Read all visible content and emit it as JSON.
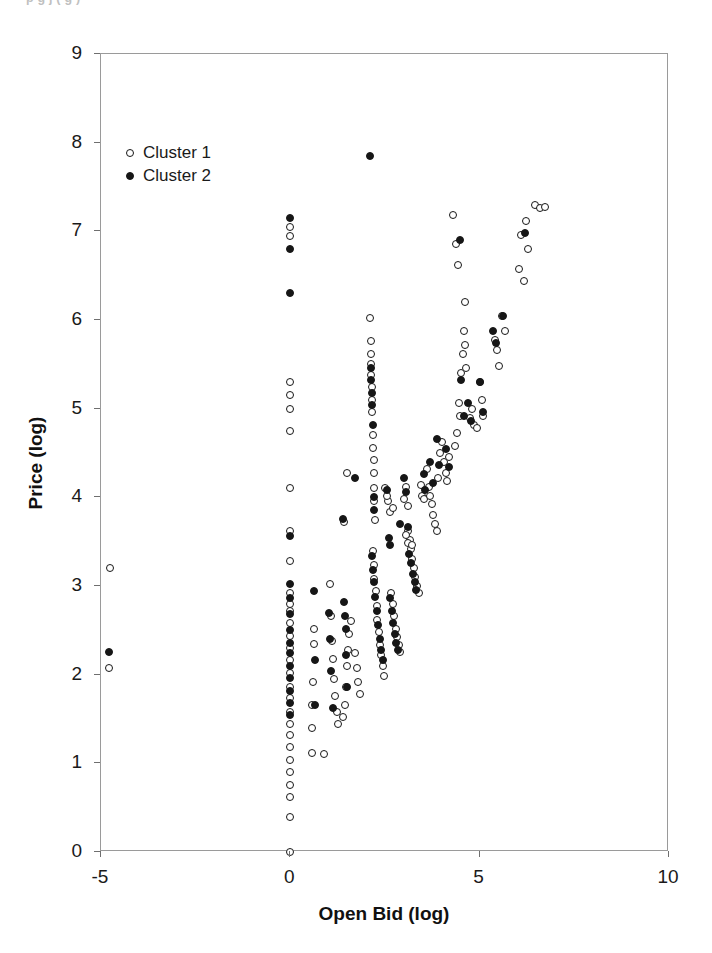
{
  "figure": {
    "cropped_caption": "p g j ( g )",
    "background_color": "#ffffff",
    "frame_color": "#9a9a9a",
    "marker_color": "#161616"
  },
  "chart_data": {
    "type": "scatter",
    "title": "",
    "xlabel": "Open Bid (log)",
    "ylabel": "Price (log)",
    "xlim": [
      -5,
      10
    ],
    "ylim": [
      0,
      9
    ],
    "xticks": [
      -5,
      0,
      5,
      10
    ],
    "yticks": [
      0,
      1,
      2,
      3,
      4,
      5,
      6,
      7,
      8,
      9
    ],
    "xtick_labels": [
      "-5",
      "0",
      "5",
      "10"
    ],
    "ytick_labels": [
      "0",
      "1",
      "2",
      "3",
      "4",
      "5",
      "6",
      "7",
      "8",
      "9"
    ],
    "grid": false,
    "legend_position": "upper-left-inside",
    "series": [
      {
        "name": "Cluster 1",
        "marker": "open-circle",
        "color": "#161616",
        "points": [
          [
            -4.75,
            3.2
          ],
          [
            -4.78,
            2.08
          ],
          [
            0.0,
            7.05
          ],
          [
            0.0,
            6.95
          ],
          [
            0.0,
            5.3
          ],
          [
            0.0,
            5.15
          ],
          [
            0.0,
            5.0
          ],
          [
            0.0,
            4.75
          ],
          [
            0.0,
            4.1
          ],
          [
            0.0,
            3.62
          ],
          [
            0.0,
            3.28
          ],
          [
            0.0,
            2.92
          ],
          [
            0.0,
            2.8
          ],
          [
            0.0,
            2.72
          ],
          [
            0.0,
            2.58
          ],
          [
            0.0,
            2.44
          ],
          [
            0.0,
            2.3
          ],
          [
            0.0,
            2.16
          ],
          [
            0.0,
            2.02
          ],
          [
            0.0,
            1.86
          ],
          [
            0.0,
            1.74
          ],
          [
            0.0,
            1.58
          ],
          [
            0.0,
            1.44
          ],
          [
            0.0,
            1.32
          ],
          [
            0.0,
            1.18
          ],
          [
            0.0,
            1.04
          ],
          [
            0.0,
            0.9
          ],
          [
            0.0,
            0.76
          ],
          [
            0.0,
            0.62
          ],
          [
            0.0,
            0.4
          ],
          [
            0.0,
            0.0
          ],
          [
            0.62,
            2.52
          ],
          [
            0.62,
            2.35
          ],
          [
            0.6,
            1.92
          ],
          [
            0.58,
            1.66
          ],
          [
            0.58,
            1.4
          ],
          [
            0.58,
            1.12
          ],
          [
            0.9,
            1.1
          ],
          [
            1.05,
            3.02
          ],
          [
            1.08,
            2.66
          ],
          [
            1.1,
            2.38
          ],
          [
            1.12,
            2.18
          ],
          [
            1.15,
            1.95
          ],
          [
            1.18,
            1.76
          ],
          [
            1.22,
            1.58
          ],
          [
            1.26,
            1.44
          ],
          [
            1.4,
            1.52
          ],
          [
            1.45,
            1.66
          ],
          [
            1.48,
            1.86
          ],
          [
            1.5,
            2.1
          ],
          [
            1.52,
            2.28
          ],
          [
            1.56,
            2.46
          ],
          [
            1.6,
            2.6
          ],
          [
            1.72,
            2.24
          ],
          [
            1.76,
            2.08
          ],
          [
            1.8,
            1.92
          ],
          [
            1.84,
            1.78
          ],
          [
            1.42,
            3.72
          ],
          [
            1.5,
            4.28
          ],
          [
            2.1,
            6.02
          ],
          [
            2.12,
            5.76
          ],
          [
            2.12,
            5.62
          ],
          [
            2.14,
            5.5
          ],
          [
            2.14,
            5.38
          ],
          [
            2.15,
            5.24
          ],
          [
            2.15,
            5.1
          ],
          [
            2.16,
            4.96
          ],
          [
            2.18,
            4.7
          ],
          [
            2.18,
            4.56
          ],
          [
            2.2,
            4.42
          ],
          [
            2.2,
            4.28
          ],
          [
            2.22,
            4.1
          ],
          [
            2.22,
            3.96
          ],
          [
            2.24,
            3.74
          ],
          [
            2.18,
            3.4
          ],
          [
            2.2,
            3.24
          ],
          [
            2.22,
            3.08
          ],
          [
            2.26,
            2.94
          ],
          [
            2.28,
            2.78
          ],
          [
            2.3,
            2.62
          ],
          [
            2.34,
            2.48
          ],
          [
            2.36,
            2.34
          ],
          [
            2.4,
            2.22
          ],
          [
            2.44,
            2.1
          ],
          [
            2.48,
            1.98
          ],
          [
            2.58,
            3.96
          ],
          [
            2.62,
            3.84
          ],
          [
            2.7,
            3.88
          ],
          [
            2.66,
            2.92
          ],
          [
            2.7,
            2.8
          ],
          [
            2.74,
            2.66
          ],
          [
            2.78,
            2.52
          ],
          [
            2.82,
            2.42
          ],
          [
            2.86,
            2.34
          ],
          [
            2.9,
            2.26
          ],
          [
            2.5,
            4.1
          ],
          [
            2.55,
            4.02
          ],
          [
            3.0,
            3.98
          ],
          [
            3.05,
            4.12
          ],
          [
            3.1,
            3.9
          ],
          [
            3.12,
            3.62
          ],
          [
            3.15,
            3.52
          ],
          [
            3.18,
            3.42
          ],
          [
            3.22,
            3.3
          ],
          [
            3.26,
            3.2
          ],
          [
            3.3,
            3.1
          ],
          [
            3.34,
            3.0
          ],
          [
            3.4,
            2.92
          ],
          [
            3.05,
            3.58
          ],
          [
            3.12,
            3.48
          ],
          [
            3.2,
            3.46
          ],
          [
            3.44,
            4.14
          ],
          [
            3.48,
            4.02
          ],
          [
            3.52,
            3.98
          ],
          [
            3.6,
            4.32
          ],
          [
            3.66,
            4.12
          ],
          [
            3.7,
            4.02
          ],
          [
            3.74,
            3.92
          ],
          [
            3.78,
            3.8
          ],
          [
            3.82,
            3.7
          ],
          [
            3.86,
            3.62
          ],
          [
            3.9,
            4.22
          ],
          [
            3.94,
            4.5
          ],
          [
            4.0,
            4.62
          ],
          [
            4.05,
            4.4
          ],
          [
            4.1,
            4.28
          ],
          [
            4.15,
            4.18
          ],
          [
            4.2,
            4.46
          ],
          [
            4.35,
            4.58
          ],
          [
            4.4,
            4.72
          ],
          [
            4.45,
            5.06
          ],
          [
            4.48,
            4.92
          ],
          [
            4.52,
            5.4
          ],
          [
            4.55,
            5.62
          ],
          [
            4.58,
            5.88
          ],
          [
            4.6,
            6.2
          ],
          [
            4.62,
            5.72
          ],
          [
            4.65,
            5.46
          ],
          [
            4.75,
            4.9
          ],
          [
            4.8,
            5.0
          ],
          [
            4.85,
            4.82
          ],
          [
            4.92,
            4.78
          ],
          [
            5.0,
            5.3
          ],
          [
            5.05,
            5.1
          ],
          [
            5.08,
            4.92
          ],
          [
            5.4,
            5.78
          ],
          [
            5.45,
            5.66
          ],
          [
            5.5,
            5.48
          ],
          [
            5.6,
            6.04
          ],
          [
            5.68,
            5.88
          ],
          [
            6.05,
            6.58
          ],
          [
            6.1,
            6.96
          ],
          [
            6.18,
            6.44
          ],
          [
            6.22,
            7.12
          ],
          [
            6.28,
            6.8
          ],
          [
            6.45,
            7.3
          ],
          [
            6.6,
            7.26
          ],
          [
            6.72,
            7.28
          ],
          [
            4.3,
            7.18
          ],
          [
            4.38,
            6.86
          ],
          [
            4.42,
            6.62
          ]
        ]
      },
      {
        "name": "Cluster 2",
        "marker": "filled-circle",
        "color": "#161616",
        "points": [
          [
            -4.78,
            2.26
          ],
          [
            0.0,
            7.15
          ],
          [
            0.0,
            6.8
          ],
          [
            0.0,
            6.3
          ],
          [
            0.0,
            3.56
          ],
          [
            0.0,
            3.02
          ],
          [
            0.0,
            2.86
          ],
          [
            0.0,
            2.68
          ],
          [
            0.0,
            2.5
          ],
          [
            0.0,
            2.36
          ],
          [
            0.0,
            2.24
          ],
          [
            0.0,
            2.1
          ],
          [
            0.0,
            1.96
          ],
          [
            0.0,
            1.82
          ],
          [
            0.0,
            1.68
          ],
          [
            0.0,
            1.54
          ],
          [
            0.62,
            2.94
          ],
          [
            0.64,
            2.16
          ],
          [
            0.66,
            1.66
          ],
          [
            1.02,
            2.7
          ],
          [
            1.05,
            2.4
          ],
          [
            1.08,
            2.04
          ],
          [
            1.12,
            1.62
          ],
          [
            1.38,
            3.76
          ],
          [
            1.42,
            2.82
          ],
          [
            1.44,
            2.66
          ],
          [
            1.46,
            2.52
          ],
          [
            1.48,
            2.22
          ],
          [
            1.5,
            1.86
          ],
          [
            1.7,
            4.22
          ],
          [
            2.1,
            7.85
          ],
          [
            2.12,
            5.46
          ],
          [
            2.14,
            5.32
          ],
          [
            2.16,
            5.18
          ],
          [
            2.16,
            5.04
          ],
          [
            2.18,
            4.82
          ],
          [
            2.2,
            4.0
          ],
          [
            2.22,
            3.86
          ],
          [
            2.16,
            3.34
          ],
          [
            2.18,
            3.18
          ],
          [
            2.2,
            3.04
          ],
          [
            2.24,
            2.88
          ],
          [
            2.28,
            2.72
          ],
          [
            2.32,
            2.56
          ],
          [
            2.36,
            2.4
          ],
          [
            2.4,
            2.28
          ],
          [
            2.46,
            2.16
          ],
          [
            2.56,
            4.08
          ],
          [
            2.6,
            3.54
          ],
          [
            2.64,
            3.46
          ],
          [
            2.62,
            2.86
          ],
          [
            2.68,
            2.72
          ],
          [
            2.72,
            2.58
          ],
          [
            2.76,
            2.46
          ],
          [
            2.8,
            2.36
          ],
          [
            2.84,
            2.28
          ],
          [
            2.9,
            3.7
          ],
          [
            3.0,
            4.22
          ],
          [
            3.06,
            4.06
          ],
          [
            3.1,
            3.66
          ],
          [
            3.14,
            3.36
          ],
          [
            3.18,
            3.26
          ],
          [
            3.24,
            3.14
          ],
          [
            3.28,
            3.04
          ],
          [
            3.32,
            2.96
          ],
          [
            3.52,
            4.26
          ],
          [
            3.56,
            4.08
          ],
          [
            3.7,
            4.4
          ],
          [
            3.76,
            4.16
          ],
          [
            3.86,
            4.66
          ],
          [
            3.92,
            4.36
          ],
          [
            4.1,
            4.54
          ],
          [
            4.2,
            4.34
          ],
          [
            4.48,
            6.9
          ],
          [
            4.52,
            5.32
          ],
          [
            4.58,
            4.92
          ],
          [
            4.7,
            5.06
          ],
          [
            4.78,
            4.86
          ],
          [
            5.0,
            5.3
          ],
          [
            5.08,
            4.96
          ],
          [
            5.35,
            5.88
          ],
          [
            5.42,
            5.74
          ],
          [
            5.62,
            6.04
          ],
          [
            6.2,
            6.98
          ]
        ]
      }
    ]
  }
}
